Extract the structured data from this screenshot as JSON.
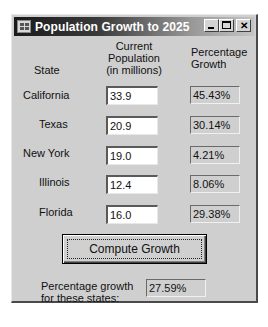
{
  "window": {
    "title": "Population Growth to 2025",
    "icon": "app-form-icon",
    "controls": {
      "minimize": "minimize-icon",
      "maximize": "maximize-icon",
      "close": "close-icon",
      "close_glyph": "✕"
    }
  },
  "headers": {
    "state": "State",
    "population_line1": "Current",
    "population_line2": "Population",
    "population_line3": "(in millions)",
    "growth_line1": "Percentage",
    "growth_line2": "Growth"
  },
  "rows": [
    {
      "state": "California",
      "population": "33.9",
      "growth": "45.43%"
    },
    {
      "state": "Texas",
      "population": "20.9",
      "growth": "30.14%"
    },
    {
      "state": "New York",
      "population": "19.0",
      "growth": "4.21%"
    },
    {
      "state": "Illinois",
      "population": "12.4",
      "growth": "8.06%"
    },
    {
      "state": "Florida",
      "population": "16.0",
      "growth": "29.38%"
    }
  ],
  "compute_button": {
    "label": "Compute Growth"
  },
  "summary": {
    "label_line1": "Percentage growth",
    "label_line2": "for these states:",
    "value": "27.59%"
  }
}
